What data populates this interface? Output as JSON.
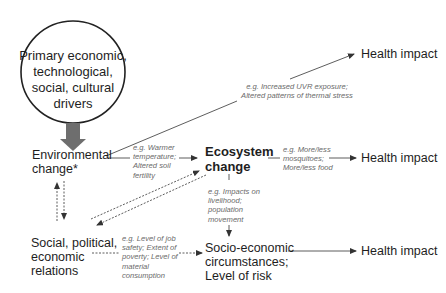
{
  "drivers": {
    "line1": "Primary economic,",
    "line2": "technological,",
    "line3": "social, cultural",
    "line4": "drivers"
  },
  "environmental_change": {
    "line1": "Environmental",
    "line2": "change*"
  },
  "ecosystem_change": {
    "line1": "Ecosystem",
    "line2": "change"
  },
  "social_relations": {
    "line1": "Social, political,",
    "line2": "economic",
    "line3": "relations"
  },
  "socio_economic": {
    "line1": "Socio-economic",
    "line2": "circumstances;",
    "line3": "Level of risk"
  },
  "health_impacts": {
    "top": "Health impact",
    "middle": "Health impact",
    "bottom": "Health impact"
  },
  "notes": {
    "uvr": {
      "line1": "e.g. Increased UVR exposure;",
      "line2": "Altered patterns of thermal stress"
    },
    "warmer": {
      "line1": "e.g. Warmer",
      "line2": "temperature;",
      "line3": "Altered soil",
      "line4": "fertility"
    },
    "mosquitoes": {
      "line1": "e.g. More/less",
      "line2": "mosquitoes;",
      "line3": "More/less food"
    },
    "livelihood": {
      "line1": "e.g. Impacts on",
      "line2": "livelihood;",
      "line3": "population",
      "line4": "movement"
    },
    "job_safety": {
      "line1": "e.g. Level of job",
      "line2": "safety; Extent of",
      "line3": "poverty; Level of",
      "line4": "material",
      "line5": "consumption"
    }
  },
  "colors": {
    "arrow": "#333333",
    "big_arrow": "#6e6e6e",
    "note_text": "#6a6a6a",
    "node_text": "#1e1e1e"
  }
}
